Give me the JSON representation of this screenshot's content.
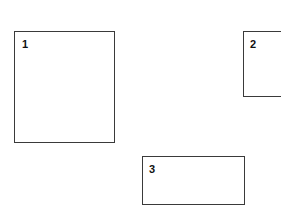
{
  "canvas": {
    "width": 281,
    "height": 212,
    "background_color": "#ffffff"
  },
  "style": {
    "border_color": "#3a3a3a",
    "border_width_px": 1.5,
    "label_color": "#111111",
    "fill_color": "#ffffff"
  },
  "diagram": {
    "title": "",
    "shapes": [
      {
        "id": "rect-1",
        "type": "rectangle",
        "label": "1",
        "x": 14,
        "y": 31,
        "width": 101,
        "height": 112,
        "label_position": "top-left-inside",
        "clipped": false
      },
      {
        "id": "rect-2",
        "type": "rectangle",
        "label": "2",
        "x": 243,
        "y": 31,
        "width": 46,
        "height": 66,
        "label_position": "top-left-inside",
        "clipped": true,
        "clipped_edge": "right"
      },
      {
        "id": "rect-3",
        "type": "rectangle",
        "label": "3",
        "x": 142,
        "y": 156,
        "width": 103,
        "height": 49,
        "label_position": "top-left-inside",
        "clipped": false
      }
    ]
  }
}
